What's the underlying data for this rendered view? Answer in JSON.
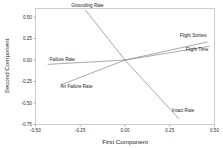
{
  "chart_data": {
    "type": "scatter",
    "title": "",
    "subtitle": "",
    "xlabel": "First Component",
    "ylabel": "Second Component",
    "xlim": [
      -0.5,
      0.5
    ],
    "ylim": [
      -0.75,
      0.6
    ],
    "grid": false,
    "legend": "none",
    "xticks": [
      "-0.50",
      "-0.25",
      "0.00",
      "0.25",
      "0.50"
    ],
    "xtick_values": [
      -0.5,
      -0.25,
      0.0,
      0.25,
      0.5
    ],
    "yticks": [
      "0.50",
      "0.25",
      "0.00",
      "-0.25",
      "-0.50",
      "-0.75"
    ],
    "ytick_values": [
      0.5,
      0.25,
      0.0,
      -0.25,
      -0.5,
      -0.75
    ],
    "origin": [
      0.0,
      0.0
    ],
    "series": [
      {
        "name": "Grounding Rate",
        "label": "Grounding Rate",
        "x": -0.22,
        "y": 0.58,
        "label_x": -0.21,
        "label_y": 0.62
      },
      {
        "name": "Failure Rate",
        "label": "Failure Rate",
        "x": -0.43,
        "y": -0.05,
        "label_x": -0.42,
        "label_y": -0.01
      },
      {
        "name": "Air Failure Rate",
        "label": "Air Failure Rate",
        "x": -0.36,
        "y": -0.29,
        "label_x": -0.36,
        "label_y": -0.33
      },
      {
        "name": "Flight Sorties",
        "label": "Flight Sorties",
        "x": 0.46,
        "y": 0.21,
        "label_x": 0.455,
        "label_y": 0.265
      },
      {
        "name": "Flight Time",
        "label": "Flight Time",
        "x": 0.47,
        "y": 0.16,
        "label_x": 0.465,
        "label_y": 0.105
      },
      {
        "name": "Intact Rate",
        "label": "Intact Rate",
        "x": 0.3,
        "y": -0.68,
        "label_x": 0.325,
        "label_y": -0.6
      }
    ]
  },
  "colors": {
    "line": "#8c8c8c",
    "frame": "#b8b8b8",
    "text": "#1a1a1a",
    "background": "#ffffff"
  }
}
